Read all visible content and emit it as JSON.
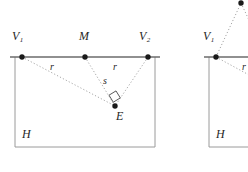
{
  "figure": {
    "type": "geometry-diagram",
    "colors": {
      "horizon_line": "#6b6b6b",
      "box_outline": "#9a9a9a",
      "dotted_line": "#a8a8a8",
      "point_fill": "#1a1a1a",
      "label_text": "#262626",
      "background": "#ffffff"
    },
    "left_diagram": {
      "points": [
        {
          "id": "V1",
          "base": "V",
          "subscript": "1",
          "x": 22,
          "y": 57
        },
        {
          "id": "M",
          "base": "M",
          "subscript": "",
          "x": 85,
          "y": 57
        },
        {
          "id": "V2",
          "base": "V",
          "subscript": "2",
          "x": 148,
          "y": 57
        },
        {
          "id": "E",
          "base": "E",
          "subscript": "",
          "x": 115,
          "y": 106
        }
      ],
      "labels": {
        "V1": "V",
        "V1_sub": "1",
        "M": "M",
        "V2": "V",
        "V2_sub": "2",
        "E": "E",
        "H": "H",
        "r_left": "r",
        "r_right": "r",
        "s": "s"
      },
      "segments": [
        {
          "from": "V1",
          "to": "M",
          "label": "r",
          "style": "solid"
        },
        {
          "from": "M",
          "to": "V2",
          "label": "r",
          "style": "solid"
        },
        {
          "from": "M",
          "to": "E",
          "label": "s",
          "style": "dotted"
        },
        {
          "from": "V1",
          "to": "E",
          "label": "",
          "style": "dotted"
        },
        {
          "from": "V2",
          "to": "E",
          "label": "",
          "style": "dotted"
        }
      ],
      "right_angle_at": "E",
      "ground_plane_label": "H"
    },
    "right_diagram": {
      "points": [
        {
          "id": "V1",
          "base": "V",
          "subscript": "1",
          "x": 216,
          "y": 57
        },
        {
          "id": "P",
          "base": "",
          "subscript": "",
          "x": 241,
          "y": 3
        }
      ],
      "labels": {
        "V1": "V",
        "V1_sub": "1",
        "H": "H",
        "r": "r"
      },
      "ground_plane_label": "H"
    }
  }
}
